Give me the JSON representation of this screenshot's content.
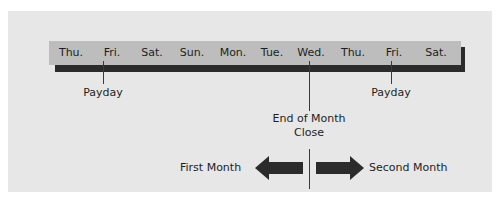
{
  "timeline": {
    "days": [
      "Thu.",
      "Fri.",
      "Sat.",
      "Sun.",
      "Mon.",
      "Tue.",
      "Wed.",
      "Thu.",
      "Fri.",
      "Sat."
    ],
    "bar_color": "#bdbdbd",
    "shadow_color": "#2b2b2b",
    "panel_color": "#e7e7e7"
  },
  "markers": {
    "payday_1": "Payday",
    "payday_2": "Payday",
    "close_line1": "End of Month",
    "close_line2": "Close"
  },
  "arrows": {
    "left_label": "First Month",
    "right_label": "Second Month"
  }
}
